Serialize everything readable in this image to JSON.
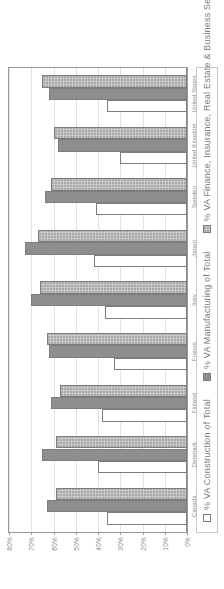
{
  "chart_data": {
    "type": "bar",
    "title": "",
    "xlabel": "",
    "ylabel": "",
    "ylim": [
      0,
      80
    ],
    "grid": true,
    "legend_position": "bottom",
    "categories": [
      "Canada",
      "Denmark",
      "Finland",
      "France",
      "Italy",
      "Japan",
      "Sweden",
      "United Kingdom",
      "United States"
    ],
    "ytick_labels": [
      "0%",
      "10%",
      "20%",
      "30%",
      "40%",
      "50%",
      "60%",
      "70%",
      "80%"
    ],
    "ytick_values": [
      0,
      10,
      20,
      30,
      40,
      50,
      60,
      70,
      80
    ],
    "series": [
      {
        "name": "% VA Construction of Total",
        "color": "#ffffff",
        "swatch": "legend-swatch-construction",
        "values": [
          36,
          40,
          38,
          33,
          37,
          42,
          41,
          30,
          36
        ]
      },
      {
        "name": "% VA Manufacturing of Total",
        "color": "#8e8e8e",
        "swatch": "legend-swatch-manufacturing",
        "values": [
          63,
          65,
          61,
          62,
          70,
          73,
          64,
          58,
          62
        ]
      },
      {
        "name": "% VA Finance, Insurance, Real Estate & Business Services of Total",
        "color": "#c9c9c9",
        "swatch": "legend-swatch-finance",
        "values": [
          59,
          59,
          57,
          63,
          66,
          67,
          61,
          60,
          65
        ]
      }
    ]
  }
}
